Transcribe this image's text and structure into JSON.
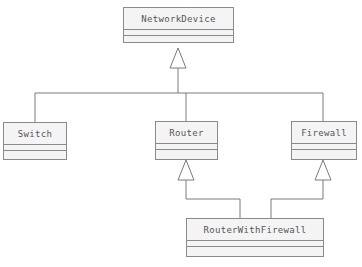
{
  "diagram": {
    "type": "uml-class-diagram",
    "classes": [
      {
        "id": "network_device",
        "name": "NetworkDevice",
        "attributes": [],
        "operations": []
      },
      {
        "id": "switch",
        "name": "Switch",
        "attributes": [],
        "operations": []
      },
      {
        "id": "router",
        "name": "Router",
        "attributes": [],
        "operations": []
      },
      {
        "id": "firewall",
        "name": "Firewall",
        "attributes": [],
        "operations": []
      },
      {
        "id": "router_with_firewall",
        "name": "RouterWithFirewall",
        "attributes": [],
        "operations": []
      }
    ],
    "relationships": [
      {
        "type": "generalization",
        "from": "Switch",
        "to": "NetworkDevice"
      },
      {
        "type": "generalization",
        "from": "Router",
        "to": "NetworkDevice"
      },
      {
        "type": "generalization",
        "from": "Firewall",
        "to": "NetworkDevice"
      },
      {
        "type": "generalization",
        "from": "RouterWithFirewall",
        "to": "Router"
      },
      {
        "type": "generalization",
        "from": "RouterWithFirewall",
        "to": "Firewall"
      }
    ]
  },
  "colors": {
    "line": "#8a8a8a",
    "box_fill": "#f4f4f4",
    "text": "#555555"
  }
}
